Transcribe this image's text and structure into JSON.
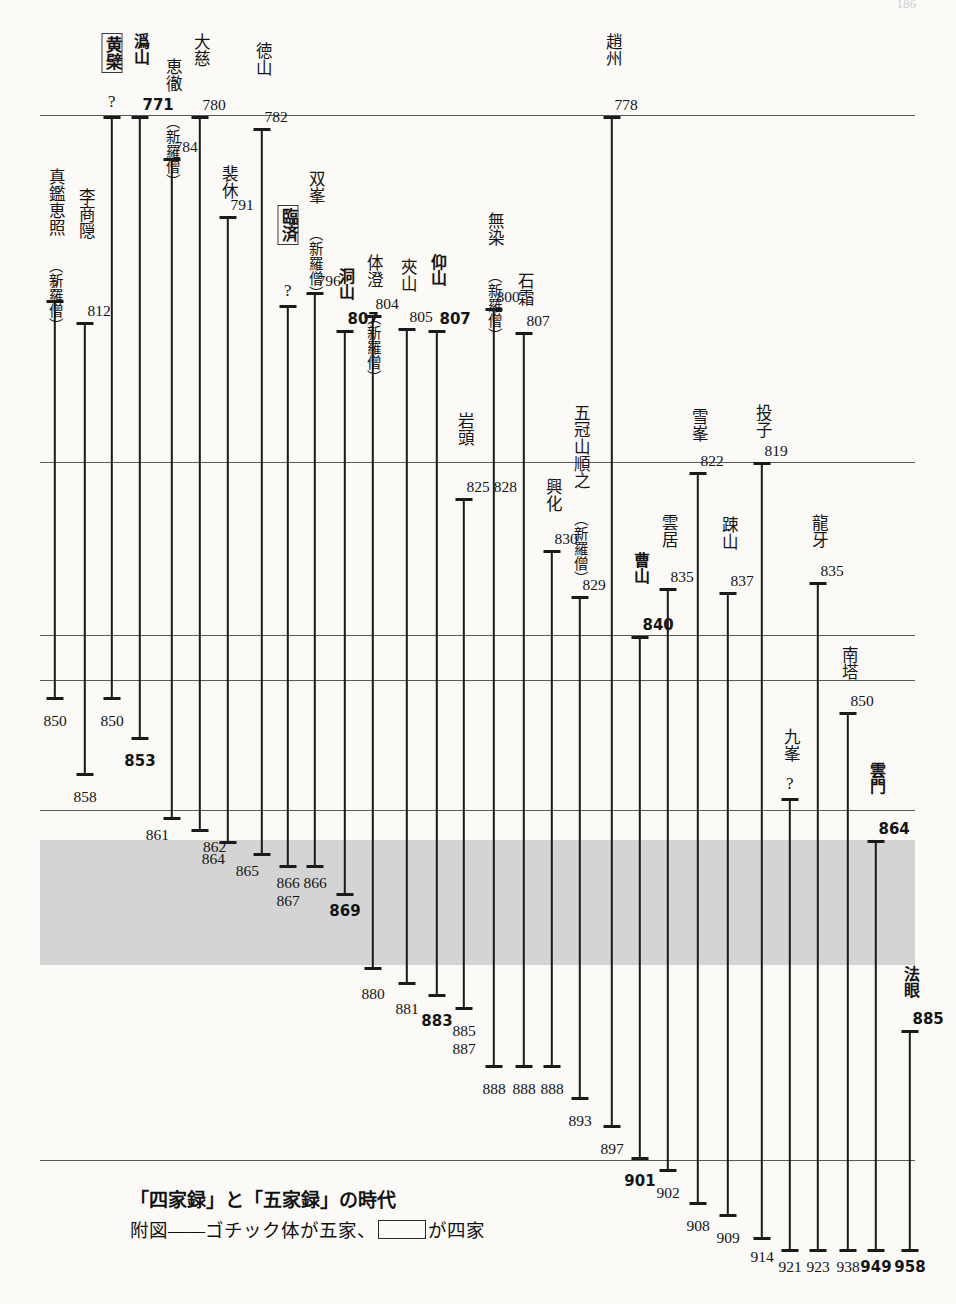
{
  "meta": {
    "page_number": "186",
    "caption_title": "「四家録」と「五家録」の時代",
    "caption_legend_pre": "附図——ゴチック体が五家、",
    "caption_legend_post": "が四家"
  },
  "chart_data": {
    "type": "timeline",
    "title": "「四家録」と「五家録」の時代",
    "subtitle": "附図——ゴチック体が五家、□が四家",
    "xlabel": "",
    "ylabel": "年",
    "grid": true,
    "gridlines_years": [
      770,
      822,
      840,
      850,
      864,
      869,
      901
    ],
    "shaded_band": {
      "from": 864,
      "to": 880,
      "color": "#d4d4d4"
    },
    "legend": [
      {
        "style": "gothic-bold",
        "meaning": "五家"
      },
      {
        "style": "boxed",
        "meaning": "四家"
      }
    ],
    "rules_y_px": [
      115,
      462,
      635,
      680,
      810,
      1160
    ],
    "band_y_px": [
      840,
      965
    ],
    "series": [
      {
        "name": "真鑑恵照",
        "start": "?",
        "end": "850",
        "style": "normal",
        "paren": "（新羅僧）",
        "x": 55,
        "label_y": 168,
        "start_y": 300,
        "end_y": 700,
        "end_num_y": 712,
        "end_align": "center"
      },
      {
        "name": "李商隠",
        "start": "812",
        "end": "858",
        "style": "normal",
        "paren": "",
        "x": 85,
        "label_y": 188,
        "start_y": 322,
        "end_y": 776,
        "end_num_y": 788,
        "end_align": "center"
      },
      {
        "name": "黄檗",
        "start": "?",
        "end": "850",
        "style": "boxed",
        "paren": "",
        "x": 112,
        "label_y": 33,
        "start_y": 116,
        "end_y": 700,
        "end_num_y": 712,
        "end_align": "center"
      },
      {
        "name": "潙山",
        "start": "771",
        "end": "853",
        "style": "gothic",
        "paren": "",
        "x": 140,
        "label_y": 33,
        "start_y": 116,
        "end_y": 740,
        "end_num_y": 752,
        "end_align": "center"
      },
      {
        "name": "恵徹",
        "start": "784",
        "end": "861",
        "style": "normal",
        "paren": "（新羅僧）",
        "x": 172,
        "label_y": 58,
        "start_y": 158,
        "end_y": 820,
        "end_num_y": 826,
        "end_align": "left"
      },
      {
        "name": "大慈",
        "start": "780",
        "end": "862",
        "style": "normal",
        "paren": "",
        "x": 200,
        "label_y": 33,
        "start_y": 116,
        "end_y": 832,
        "end_num_y": 838,
        "end_align": "right"
      },
      {
        "name": "裴休",
        "start": "791",
        "end": "864",
        "style": "normal",
        "paren": "",
        "x": 228,
        "label_y": 165,
        "start_y": 216,
        "end_y": 844,
        "end_num_y": 850,
        "end_align": "left"
      },
      {
        "name": "徳山",
        "start": "782",
        "end": "865",
        "style": "normal",
        "paren": "",
        "x": 262,
        "label_y": 42,
        "start_y": 128,
        "end_y": 856,
        "end_num_y": 862,
        "end_align": "left"
      },
      {
        "name": "臨済",
        "start": "?",
        "end": "866 867",
        "style": "boxed",
        "paren": "",
        "x": 288,
        "label_y": 205,
        "start_y": 305,
        "end_y": 868,
        "end_num_y": 874,
        "end_align": "center"
      },
      {
        "name": "双峯",
        "start": "796",
        "end": "866",
        "style": "normal",
        "paren": "（新羅僧）",
        "x": 315,
        "label_y": 170,
        "start_y": 292,
        "end_y": 868,
        "end_num_y": 874,
        "end_align": "center"
      },
      {
        "name": "洞山",
        "start": "807",
        "end": "869",
        "style": "gothic",
        "paren": "",
        "x": 345,
        "label_y": 268,
        "start_y": 330,
        "end_y": 896,
        "end_num_y": 902,
        "end_align": "center"
      },
      {
        "name": "体澄",
        "start": "804",
        "end": "880",
        "style": "normal",
        "paren": "（新羅僧）",
        "x": 373,
        "label_y": 254,
        "start_y": 315,
        "end_y": 970,
        "end_num_y": 985,
        "end_align": "center"
      },
      {
        "name": "夾山",
        "start": "805",
        "end": "881",
        "style": "normal",
        "paren": "",
        "x": 407,
        "label_y": 258,
        "start_y": 328,
        "end_y": 985,
        "end_num_y": 1000,
        "end_align": "center"
      },
      {
        "name": "仰山",
        "start": "807",
        "end": "883",
        "style": "gothic",
        "paren": "",
        "x": 437,
        "label_y": 254,
        "start_y": 330,
        "end_y": 997,
        "end_num_y": 1012,
        "end_align": "center"
      },
      {
        "name": "岩頭",
        "start": "825 828",
        "end": "885 887",
        "style": "normal",
        "paren": "",
        "x": 464,
        "label_y": 412,
        "start_y": 498,
        "end_y": 1010,
        "end_num_y": 1022,
        "end_align": "center"
      },
      {
        "name": "無染",
        "start": "800",
        "end": "888",
        "style": "normal",
        "paren": "（新羅僧）",
        "x": 494,
        "label_y": 212,
        "start_y": 308,
        "end_y": 1068,
        "end_num_y": 1080,
        "end_align": "center"
      },
      {
        "name": "石霜",
        "start": "807",
        "end": "888",
        "style": "normal",
        "paren": "",
        "x": 524,
        "label_y": 272,
        "start_y": 332,
        "end_y": 1068,
        "end_num_y": 1080,
        "end_align": "center"
      },
      {
        "name": "興化",
        "start": "830",
        "end": "888",
        "style": "normal",
        "paren": "",
        "x": 552,
        "label_y": 478,
        "start_y": 550,
        "end_y": 1068,
        "end_num_y": 1080,
        "end_align": "center"
      },
      {
        "name": "五冠山順之",
        "start": "829",
        "end": "893",
        "style": "normal",
        "paren": "（新羅僧）",
        "x": 580,
        "label_y": 404,
        "start_y": 596,
        "end_y": 1100,
        "end_num_y": 1112,
        "end_align": "center"
      },
      {
        "name": "趙州",
        "start": "778",
        "end": "897",
        "style": "normal",
        "paren": "",
        "x": 612,
        "label_y": 33,
        "start_y": 116,
        "end_y": 1128,
        "end_num_y": 1140,
        "end_align": "center"
      },
      {
        "name": "曹山",
        "start": "840",
        "end": "901",
        "style": "gothic",
        "paren": "",
        "x": 640,
        "label_y": 552,
        "start_y": 636,
        "end_y": 1160,
        "end_num_y": 1172,
        "end_align": "center"
      },
      {
        "name": "雲居",
        "start": "835",
        "end": "902",
        "style": "normal",
        "paren": "",
        "x": 668,
        "label_y": 514,
        "start_y": 588,
        "end_y": 1172,
        "end_num_y": 1184,
        "end_align": "center"
      },
      {
        "name": "雪峯",
        "start": "822",
        "end": "908",
        "style": "normal",
        "paren": "",
        "x": 698,
        "label_y": 408,
        "start_y": 472,
        "end_y": 1205,
        "end_num_y": 1217,
        "end_align": "center"
      },
      {
        "name": "踈山",
        "start": "837",
        "end": "909",
        "style": "normal",
        "paren": "",
        "x": 728,
        "label_y": 516,
        "start_y": 592,
        "end_y": 1217,
        "end_num_y": 1229,
        "end_align": "center"
      },
      {
        "name": "投子",
        "start": "819",
        "end": "914",
        "style": "normal",
        "paren": "",
        "x": 762,
        "label_y": 404,
        "start_y": 462,
        "end_y": 1240,
        "end_num_y": 1248,
        "end_align": "center"
      },
      {
        "name": "九峯",
        "start": "?",
        "end": "921",
        "style": "normal",
        "paren": "",
        "x": 790,
        "label_y": 728,
        "start_y": 798,
        "end_y": 1252,
        "end_num_y": 1258,
        "end_align": "center"
      },
      {
        "name": "龍牙",
        "start": "835",
        "end": "923",
        "style": "normal",
        "paren": "",
        "x": 818,
        "label_y": 514,
        "start_y": 582,
        "end_y": 1252,
        "end_num_y": 1258,
        "end_align": "center"
      },
      {
        "name": "南塔",
        "start": "850",
        "end": "938",
        "style": "normal",
        "paren": "",
        "x": 848,
        "label_y": 646,
        "start_y": 712,
        "end_y": 1252,
        "end_num_y": 1258,
        "end_align": "center"
      },
      {
        "name": "雲門",
        "start": "864",
        "end": "949",
        "style": "gothic",
        "paren": "",
        "x": 876,
        "label_y": 762,
        "start_y": 840,
        "end_y": 1252,
        "end_num_y": 1258,
        "end_align": "center"
      },
      {
        "name": "法眼",
        "start": "885",
        "end": "958",
        "style": "gothic",
        "paren": "",
        "x": 910,
        "label_y": 966,
        "start_y": 1030,
        "end_y": 1252,
        "end_num_y": 1258,
        "end_align": "center"
      }
    ]
  }
}
